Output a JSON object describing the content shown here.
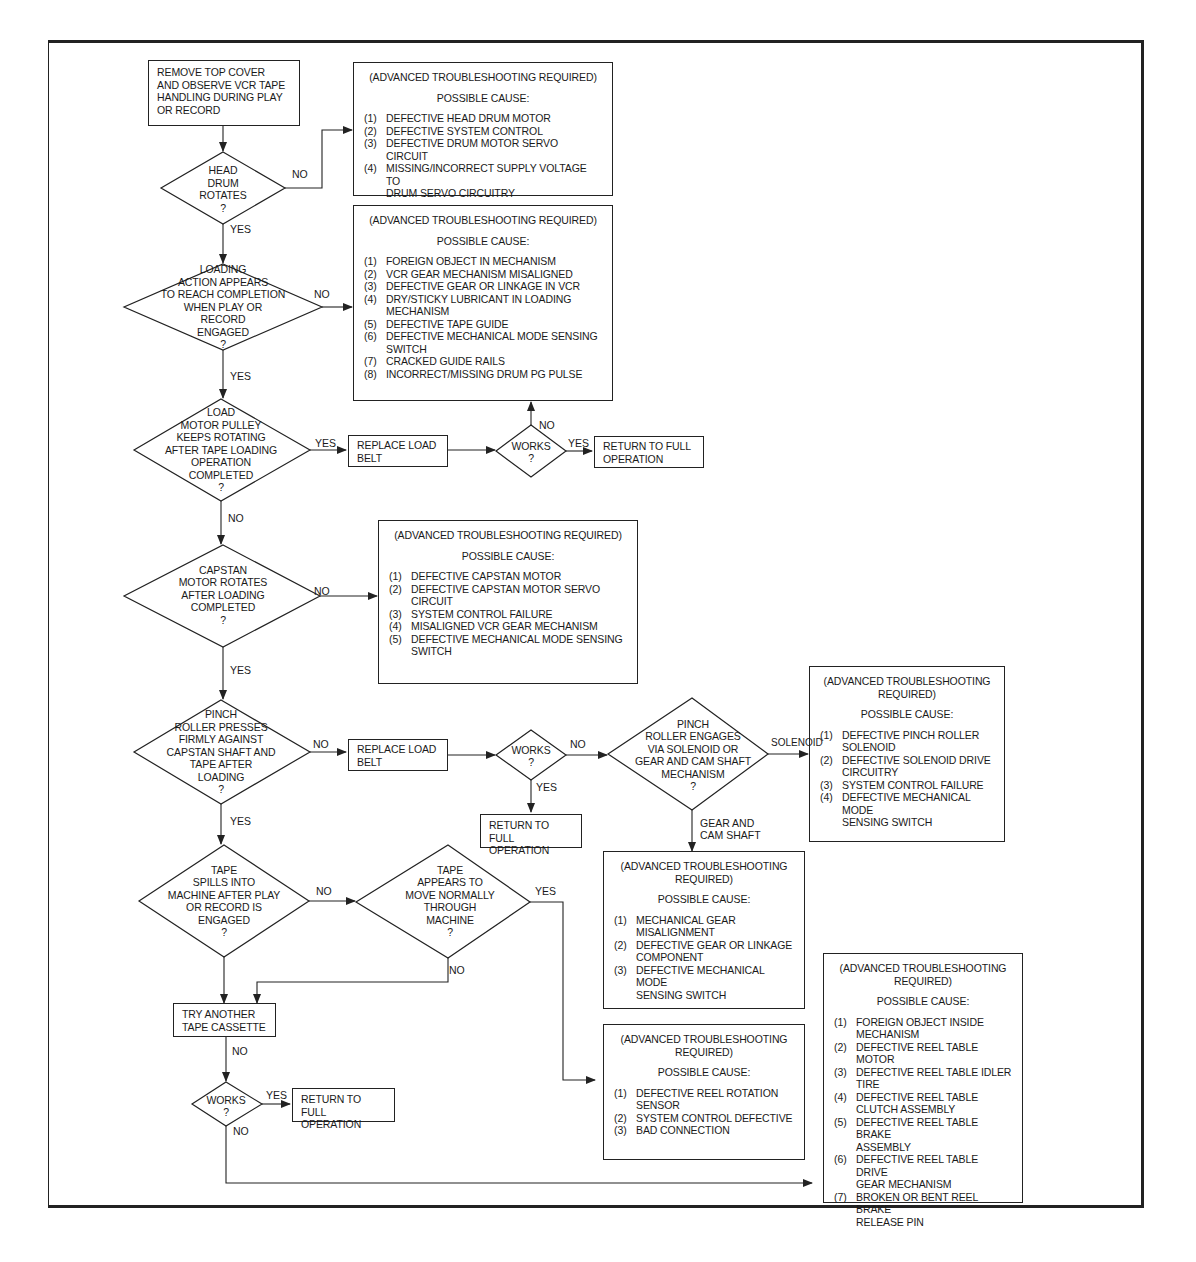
{
  "flowchart": {
    "start": {
      "text": [
        "REMOVE TOP COVER",
        "AND OBSERVE VCR TAPE",
        "HANDLING DURING PLAY",
        "OR RECORD"
      ]
    },
    "decisions": {
      "head_drum": [
        "HEAD",
        "DRUM",
        "ROTATES",
        "?"
      ],
      "loading_action": [
        "LOADING",
        "ACTION APPEARS",
        "TO REACH COMPLETION",
        "WHEN PLAY OR",
        "RECORD",
        "ENGAGED",
        "?"
      ],
      "load_motor": [
        "LOAD",
        "MOTOR PULLEY",
        "KEEPS ROTATING",
        "AFTER TAPE LOADING",
        "OPERATION",
        "COMPLETED",
        "?"
      ],
      "works_1": [
        "WORKS",
        "?"
      ],
      "capstan": [
        "CAPSTAN",
        "MOTOR ROTATES",
        "AFTER LOADING",
        "COMPLETED",
        "?"
      ],
      "pinch_roller": [
        "PINCH",
        "ROLLER PRESSES",
        "FIRMLY AGAINST",
        "CAPSTAN SHAFT AND",
        "TAPE AFTER",
        "LOADING",
        "?"
      ],
      "works_2": [
        "WORKS",
        "?"
      ],
      "pinch_engages": [
        "PINCH",
        "ROLLER ENGAGES",
        "VIA SOLENOID OR",
        "GEAR AND CAM SHAFT",
        "MECHANISM",
        "?"
      ],
      "tape_spills": [
        "TAPE",
        "SPILLS INTO",
        "MACHINE AFTER PLAY",
        "OR RECORD IS",
        "ENGAGED",
        "?"
      ],
      "tape_moves": [
        "TAPE",
        "APPEARS TO",
        "MOVE NORMALLY",
        "THROUGH",
        "MACHINE",
        "?"
      ],
      "works_3": [
        "WORKS",
        "?"
      ]
    },
    "actions": {
      "replace_belt_1": [
        "REPLACE LOAD",
        "BELT"
      ],
      "return_1": [
        "RETURN TO FULL",
        "OPERATION"
      ],
      "replace_belt_2": [
        "REPLACE LOAD",
        "BELT"
      ],
      "return_2": [
        "RETURN TO FULL",
        "OPERATION"
      ],
      "try_cassette": [
        "TRY ANOTHER",
        "TAPE CASSETTE"
      ],
      "return_3": [
        "RETURN TO FULL",
        "OPERATION"
      ]
    },
    "causes": {
      "head_drum": {
        "header": [
          "(ADVANCED TROUBLESHOOTING REQUIRED)"
        ],
        "possible": "POSSIBLE CAUSE:",
        "items": [
          {
            "n": "(1)",
            "t": [
              "DEFECTIVE HEAD DRUM MOTOR"
            ]
          },
          {
            "n": "(2)",
            "t": [
              "DEFECTIVE SYSTEM CONTROL"
            ]
          },
          {
            "n": "(3)",
            "t": [
              "DEFECTIVE DRUM MOTOR SERVO CIRCUIT"
            ]
          },
          {
            "n": "(4)",
            "t": [
              "MISSING/INCORRECT SUPPLY VOLTAGE TO",
              "DRUM SERVO CIRCUITRY"
            ]
          }
        ]
      },
      "loading": {
        "header": [
          "(ADVANCED TROUBLESHOOTING REQUIRED)"
        ],
        "possible": "POSSIBLE CAUSE:",
        "items": [
          {
            "n": "(1)",
            "t": [
              "FOREIGN OBJECT IN MECHANISM"
            ]
          },
          {
            "n": "(2)",
            "t": [
              "VCR GEAR MECHANISM MISALIGNED"
            ]
          },
          {
            "n": "(3)",
            "t": [
              "DEFECTIVE GEAR OR LINKAGE IN VCR"
            ]
          },
          {
            "n": "(4)",
            "t": [
              "DRY/STICKY LUBRICANT IN LOADING",
              "MECHANISM"
            ]
          },
          {
            "n": "(5)",
            "t": [
              "DEFECTIVE TAPE GUIDE"
            ]
          },
          {
            "n": "(6)",
            "t": [
              "DEFECTIVE MECHANICAL MODE SENSING",
              "SWITCH"
            ]
          },
          {
            "n": "(7)",
            "t": [
              "CRACKED GUIDE RAILS"
            ]
          },
          {
            "n": "(8)",
            "t": [
              "INCORRECT/MISSING DRUM PG PULSE"
            ]
          }
        ]
      },
      "capstan": {
        "header": [
          "(ADVANCED TROUBLESHOOTING REQUIRED)"
        ],
        "possible": "POSSIBLE CAUSE:",
        "items": [
          {
            "n": "(1)",
            "t": [
              "DEFECTIVE CAPSTAN MOTOR"
            ]
          },
          {
            "n": "(2)",
            "t": [
              "DEFECTIVE CAPSTAN MOTOR SERVO",
              "CIRCUIT"
            ]
          },
          {
            "n": "(3)",
            "t": [
              "SYSTEM CONTROL FAILURE"
            ]
          },
          {
            "n": "(4)",
            "t": [
              "MISALIGNED VCR GEAR MECHANISM"
            ]
          },
          {
            "n": "(5)",
            "t": [
              "DEFECTIVE MECHANICAL MODE SENSING",
              "SWITCH"
            ]
          }
        ]
      },
      "solenoid": {
        "header": [
          "(ADVANCED TROUBLESHOOTING",
          "REQUIRED)"
        ],
        "possible": "POSSIBLE CAUSE:",
        "items": [
          {
            "n": "(1)",
            "t": [
              "DEFECTIVE PINCH ROLLER",
              "SOLENOID"
            ]
          },
          {
            "n": "(2)",
            "t": [
              "DEFECTIVE SOLENOID DRIVE",
              "CIRCUITRY"
            ]
          },
          {
            "n": "(3)",
            "t": [
              "SYSTEM CONTROL FAILURE"
            ]
          },
          {
            "n": "(4)",
            "t": [
              "DEFECTIVE MECHANICAL MODE",
              "SENSING SWITCH"
            ]
          }
        ]
      },
      "gear_cam": {
        "header": [
          "(ADVANCED TROUBLESHOOTING",
          "REQUIRED)"
        ],
        "possible": "POSSIBLE CAUSE:",
        "items": [
          {
            "n": "(1)",
            "t": [
              "MECHANICAL GEAR",
              "MISALIGNMENT"
            ]
          },
          {
            "n": "(2)",
            "t": [
              "DEFECTIVE GEAR OR LINKAGE",
              "COMPONENT"
            ]
          },
          {
            "n": "(3)",
            "t": [
              "DEFECTIVE MECHANICAL MODE",
              "SENSING SWITCH"
            ]
          }
        ]
      },
      "reel_sensor": {
        "header": [
          "(ADVANCED TROUBLESHOOTING",
          "REQUIRED)"
        ],
        "possible": "POSSIBLE CAUSE:",
        "items": [
          {
            "n": "(1)",
            "t": [
              "DEFECTIVE REEL ROTATION",
              "SENSOR"
            ]
          },
          {
            "n": "(2)",
            "t": [
              "SYSTEM CONTROL DEFECTIVE"
            ]
          },
          {
            "n": "(3)",
            "t": [
              "BAD CONNECTION"
            ]
          }
        ]
      },
      "reel_table": {
        "header": [
          "(ADVANCED TROUBLESHOOTING",
          "REQUIRED)"
        ],
        "possible": "POSSIBLE CAUSE:",
        "items": [
          {
            "n": "(1)",
            "t": [
              "FOREIGN OBJECT INSIDE",
              "MECHANISM"
            ]
          },
          {
            "n": "(2)",
            "t": [
              "DEFECTIVE REEL TABLE MOTOR"
            ]
          },
          {
            "n": "(3)",
            "t": [
              "DEFECTIVE REEL TABLE IDLER",
              "TIRE"
            ]
          },
          {
            "n": "(4)",
            "t": [
              "DEFECTIVE REEL TABLE",
              "CLUTCH ASSEMBLY"
            ]
          },
          {
            "n": "(5)",
            "t": [
              "DEFECTIVE REEL TABLE BRAKE",
              "ASSEMBLY"
            ]
          },
          {
            "n": "(6)",
            "t": [
              "DEFECTIVE REEL TABLE DRIVE",
              "GEAR MECHANISM"
            ]
          },
          {
            "n": "(7)",
            "t": [
              "BROKEN OR BENT REEL BRAKE",
              "RELEASE PIN"
            ]
          }
        ]
      }
    },
    "edge_labels": {
      "no": "NO",
      "yes": "YES",
      "solenoid": "SOLENOID",
      "gear_cam": [
        "GEAR AND",
        "CAM SHAFT"
      ]
    },
    "colors": {
      "line": "#222222",
      "background": "#ffffff",
      "text": "#1a1a1a"
    }
  }
}
